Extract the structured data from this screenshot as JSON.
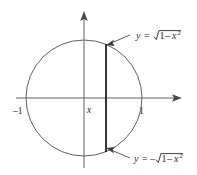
{
  "figure": {
    "type": "math-diagram",
    "background_color": "#ffffff",
    "stroke_color": "#5a5a5a",
    "chord_color": "#1a1a1a",
    "text_color": "#2b2b2b"
  },
  "axes": {
    "x_axis_label": "",
    "y_axis_label": "",
    "ticks": [
      {
        "name": "left-tick",
        "label": "–1",
        "value": -1
      },
      {
        "name": "right-tick",
        "label": "1",
        "value": 1
      }
    ],
    "variable_marker": {
      "name": "x-marker",
      "label": "x"
    }
  },
  "curve": {
    "shape": "circle",
    "equation": "x² + y² = 1",
    "center": [
      0,
      0
    ],
    "radius": 1
  },
  "chord": {
    "name": "vertical-chord",
    "at_x": 0.38,
    "from_y": -0.925,
    "to_y": 0.925
  },
  "annotations": {
    "upper": {
      "y_text": "y",
      "equals": "=",
      "sign": "",
      "radical": "√",
      "radicand_a": "1",
      "minus": "–",
      "radicand_b": "x",
      "exponent": "2",
      "full": "y = √(1 – x²)"
    },
    "lower": {
      "y_text": "y",
      "equals": "=",
      "sign": "–",
      "radical": "√",
      "radicand_a": "1",
      "minus": "–",
      "radicand_b": "x",
      "exponent": "2",
      "full": "y = –√(1 – x²)"
    }
  }
}
